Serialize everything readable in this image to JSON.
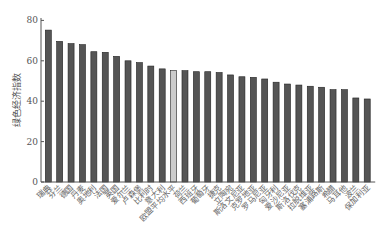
{
  "chart_data": {
    "type": "bar",
    "title": "",
    "xlabel": "",
    "ylabel": "绿色经济指数",
    "ylim": [
      0,
      80
    ],
    "yticks": [
      0,
      20,
      40,
      60,
      80
    ],
    "grid": false,
    "legend": null,
    "categories": [
      "瑞典",
      "芬兰",
      "德国",
      "丹麦",
      "奥地利",
      "法国",
      "英国",
      "爱尔兰",
      "卢森堡",
      "比利时",
      "意大利",
      "欧盟平均水平",
      "荷兰",
      "西班牙",
      "葡萄牙",
      "捷克",
      "立陶宛",
      "斯洛文尼亚",
      "克罗地亚",
      "罗马尼亚",
      "匈牙利",
      "爱沙尼亚",
      "斯洛伐克",
      "拉脱维亚",
      "塞浦路斯",
      "希腊",
      "马耳他",
      "波兰",
      "保加利亚"
    ],
    "values": [
      75.2,
      69.6,
      68.5,
      68.0,
      64.5,
      64.2,
      62.2,
      60.0,
      59.1,
      57.4,
      56.0,
      55.1,
      55.1,
      54.6,
      54.6,
      54.2,
      53.0,
      52.1,
      51.8,
      51.0,
      49.4,
      48.5,
      48.0,
      47.4,
      46.9,
      45.7,
      45.7,
      41.6,
      41.1
    ],
    "highlight_index": 11,
    "colors": {
      "bar": "#555555",
      "highlight": "#cccccc",
      "edge": "#222222",
      "axis": "#555555"
    }
  }
}
